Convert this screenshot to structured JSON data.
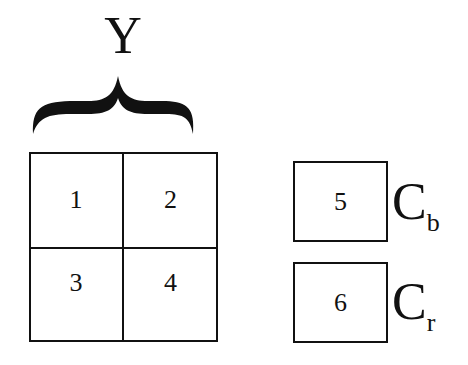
{
  "luma": {
    "label": "Y",
    "blocks": [
      "1",
      "2",
      "3",
      "4"
    ]
  },
  "chroma": [
    {
      "block": "5",
      "label_main": "C",
      "label_sub": "b"
    },
    {
      "block": "6",
      "label_main": "C",
      "label_sub": "r"
    }
  ]
}
